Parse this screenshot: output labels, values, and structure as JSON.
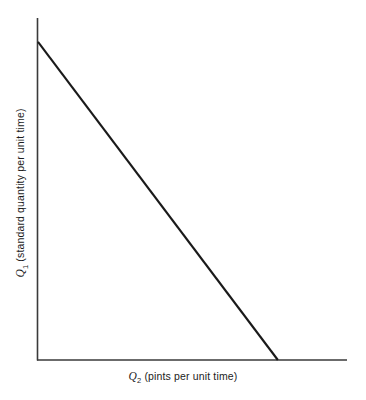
{
  "figure": {
    "width": 366,
    "height": 400,
    "background": "#ffffff",
    "line_color": "#1a1a1a",
    "axis_color": "#3a3a3a"
  },
  "axes": {
    "x": {
      "symbol": "Q",
      "subscript": "2",
      "unit_text": "(pints per unit time)",
      "label": "Q2 (pints per unit time)",
      "origin_px": 37,
      "end_px": 347,
      "baseline_px": 360
    },
    "y": {
      "symbol": "Q",
      "subscript": "1",
      "unit_text": "(standard quantity per unit time)",
      "label": "Q1 (standard quantity per unit time)",
      "top_px": 18,
      "bottom_px": 360,
      "position_px": 37
    }
  },
  "chart_data": {
    "type": "line",
    "title": "",
    "xlabel": "Q2 (pints per unit time)",
    "ylabel": "Q1 (standard quantity per unit time)",
    "grid": false,
    "legend": "none",
    "xlim": [
      0,
      1
    ],
    "ylim": [
      0,
      1
    ],
    "series": [
      {
        "name": "budget-constraint",
        "style": "solid",
        "color": "#1a1a1a",
        "x": [
          0,
          0.777
        ],
        "y": [
          0.93,
          0
        ]
      }
    ],
    "annotations": []
  }
}
